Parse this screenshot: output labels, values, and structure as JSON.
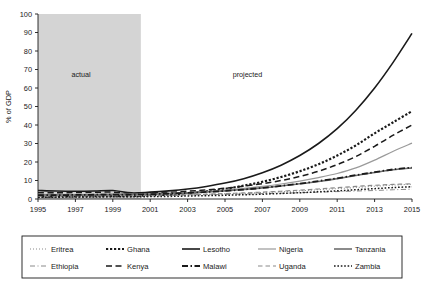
{
  "chart_data": {
    "type": "line",
    "title": "",
    "xlabel": "",
    "ylabel": "% of GDP",
    "xlim": [
      1995,
      2015
    ],
    "ylim": [
      0,
      100
    ],
    "grid": false,
    "legend_position": "bottom",
    "x": [
      1995,
      1996,
      1997,
      1998,
      1999,
      2000,
      2001,
      2002,
      2003,
      2004,
      2005,
      2006,
      2007,
      2008,
      2009,
      2010,
      2011,
      2012,
      2013,
      2014,
      2015
    ],
    "xticks": [
      "1995",
      "1997",
      "1999",
      "2001",
      "2003",
      "2005",
      "2007",
      "2009",
      "2011",
      "2013",
      "2015"
    ],
    "yticks": [
      "0",
      "10",
      "20",
      "30",
      "40",
      "50",
      "60",
      "70",
      "80",
      "90",
      "100"
    ],
    "annotations": [
      {
        "text": "actual",
        "x": 1997.3,
        "y": 66
      },
      {
        "text": "projected",
        "x": 2006.2,
        "y": 66
      }
    ],
    "shaded_region": {
      "label": "actual",
      "x_start": 1995,
      "x_end": 2000.5,
      "color": "#d4d4d4"
    },
    "series": [
      {
        "name": "Eritrea",
        "style": "dotted-fine",
        "color": "#8a8a8a",
        "width": 1.1,
        "values": [
          1.6,
          1.5,
          1.5,
          1.6,
          1.7,
          1.7,
          1.8,
          2.0,
          2.2,
          2.5,
          2.8,
          3.1,
          3.5,
          3.9,
          4.4,
          5.0,
          5.6,
          6.2,
          6.9,
          7.5,
          8.0
        ]
      },
      {
        "name": "Ethiopia",
        "style": "dashdot",
        "color": "#8a8a8a",
        "width": 1.0,
        "values": [
          2.0,
          1.9,
          1.8,
          1.8,
          1.9,
          2.0,
          2.0,
          2.1,
          2.2,
          2.3,
          2.5,
          2.7,
          2.9,
          3.1,
          3.4,
          3.7,
          4.0,
          4.3,
          4.6,
          5.0,
          5.3
        ]
      },
      {
        "name": "Ghana",
        "style": "dotted-bold",
        "color": "#1a1a1a",
        "width": 2.2,
        "values": [
          1.2,
          1.3,
          1.4,
          1.5,
          1.5,
          1.6,
          1.9,
          2.4,
          3.2,
          4.2,
          5.5,
          7.2,
          9.3,
          11.9,
          15.0,
          18.8,
          23.5,
          29.0,
          35.5,
          41.5,
          47.5
        ]
      },
      {
        "name": "Kenya",
        "style": "dashed-long",
        "color": "#1a1a1a",
        "width": 1.5,
        "values": [
          3.4,
          3.4,
          3.5,
          3.6,
          3.7,
          2.9,
          3.2,
          3.6,
          4.2,
          4.9,
          5.8,
          6.9,
          8.3,
          10.0,
          12.2,
          15.0,
          18.6,
          23.0,
          28.5,
          34.5,
          40.0
        ]
      },
      {
        "name": "Lesotho",
        "style": "solid",
        "color": "#1a1a1a",
        "width": 1.6,
        "values": [
          4.6,
          4.3,
          4.2,
          4.3,
          4.6,
          3.3,
          3.7,
          4.4,
          5.4,
          6.8,
          8.6,
          11.0,
          14.2,
          18.3,
          23.5,
          30.0,
          38.0,
          48.0,
          60.0,
          74.0,
          89.5
        ]
      },
      {
        "name": "Nigeria",
        "style": "solid-light",
        "color": "#9a9a9a",
        "width": 1.2,
        "values": [
          2.5,
          2.4,
          2.4,
          2.5,
          2.6,
          2.6,
          2.8,
          3.1,
          3.5,
          4.1,
          4.8,
          5.7,
          6.8,
          8.1,
          9.7,
          11.6,
          13.8,
          16.8,
          21.0,
          25.8,
          30.2
        ]
      },
      {
        "name": "Tanzania",
        "style": "solid-gray",
        "color": "#6e6e6e",
        "width": 1.6,
        "values": [
          2.2,
          2.2,
          2.2,
          2.3,
          2.4,
          2.4,
          2.6,
          2.9,
          3.3,
          3.8,
          4.4,
          5.1,
          6.0,
          7.0,
          8.2,
          9.5,
          11.0,
          12.7,
          14.3,
          15.8,
          16.8
        ]
      },
      {
        "name": "Uganda",
        "style": "dashed-med",
        "color": "#8a8a8a",
        "width": 1.2,
        "values": [
          1.4,
          1.4,
          1.5,
          1.6,
          1.7,
          1.8,
          1.9,
          2.1,
          2.3,
          2.6,
          2.9,
          3.3,
          3.7,
          4.2,
          4.8,
          5.4,
          6.1,
          6.8,
          7.4,
          7.9,
          8.2
        ]
      },
      {
        "name": "Malawi",
        "style": "dashdot-bold",
        "color": "#1a1a1a",
        "width": 1.8,
        "values": [
          2.1,
          2.1,
          2.2,
          2.3,
          2.4,
          2.4,
          2.6,
          2.9,
          3.3,
          3.8,
          4.4,
          5.1,
          6.0,
          7.1,
          8.3,
          9.7,
          11.2,
          12.9,
          14.5,
          16.0,
          17.0
        ]
      },
      {
        "name": "Zambia",
        "style": "dotted-med",
        "color": "#1a1a1a",
        "width": 1.5,
        "values": [
          1.0,
          1.0,
          1.1,
          1.1,
          1.2,
          1.2,
          1.3,
          1.4,
          1.6,
          1.8,
          2.0,
          2.3,
          2.6,
          3.0,
          3.4,
          3.9,
          4.4,
          5.0,
          5.6,
          6.2,
          6.6
        ]
      }
    ]
  },
  "legend": {
    "entries": [
      {
        "label": "Eritrea"
      },
      {
        "label": "Ghana"
      },
      {
        "label": "Lesotho"
      },
      {
        "label": "Nigeria"
      },
      {
        "label": "Tanzania"
      },
      {
        "label": "Ethiopia"
      },
      {
        "label": "Kenya"
      },
      {
        "label": "Malawi"
      },
      {
        "label": "Uganda"
      },
      {
        "label": "Zambia"
      }
    ]
  }
}
